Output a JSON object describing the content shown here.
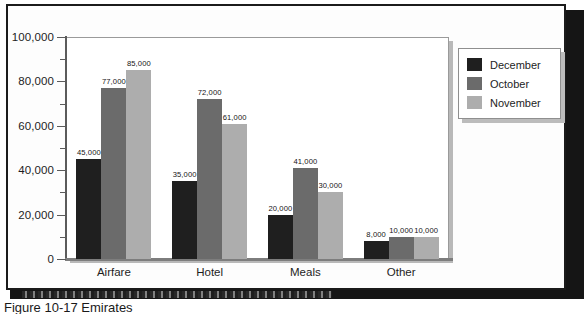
{
  "figure": {
    "caption": "Figure 10-17  Emirates"
  },
  "chart_data": {
    "type": "bar",
    "title": "",
    "xlabel": "",
    "ylabel": "",
    "categories": [
      "Airfare",
      "Hotel",
      "Meals",
      "Other"
    ],
    "series": [
      {
        "name": "December",
        "color": "#1f1f1f",
        "values": [
          45000,
          35000,
          20000,
          8000
        ]
      },
      {
        "name": "October",
        "color": "#6b6b6b",
        "values": [
          77000,
          72000,
          41000,
          10000
        ]
      },
      {
        "name": "November",
        "color": "#adadad",
        "values": [
          85000,
          61000,
          30000,
          10000
        ]
      }
    ],
    "value_labels": [
      [
        "45,000",
        "77,000",
        "85,000"
      ],
      [
        "35,000",
        "72,000",
        "61,000"
      ],
      [
        "20,000",
        "41,000",
        "30,000"
      ],
      [
        "8,000",
        "10,000",
        "10,000"
      ]
    ],
    "ylim": [
      0,
      100000
    ],
    "y_major_ticks": [
      0,
      20000,
      40000,
      60000,
      80000,
      100000
    ],
    "y_tick_labels": [
      "0",
      "20,000",
      "40,000",
      "60,000",
      "80,000",
      "100,000"
    ],
    "y_minor_ticks": [
      10000,
      30000,
      50000,
      70000,
      90000
    ],
    "grid": false,
    "legend_position": "right",
    "legend_entries": [
      "December",
      "October",
      "November"
    ]
  }
}
